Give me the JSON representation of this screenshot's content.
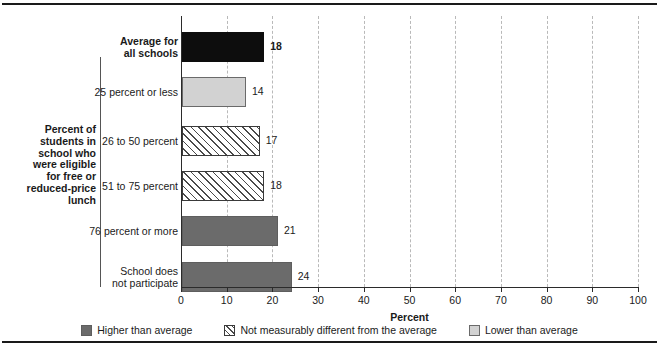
{
  "chart_data": {
    "type": "bar",
    "orientation": "horizontal",
    "title": "",
    "xlabel": "Percent",
    "ylabel": "Percent of students in school who were eligible for free or reduced-price lunch",
    "xlim": [
      0,
      100
    ],
    "xticks": [
      0,
      10,
      20,
      30,
      40,
      50,
      60,
      70,
      80,
      90,
      100
    ],
    "xtick_labels": [
      "0",
      "10",
      "20",
      "30",
      "40",
      "50",
      "60",
      "70",
      "80",
      "90",
      "100"
    ],
    "grid": "vertical-dashed",
    "legend_position": "bottom-center",
    "categories": [
      "Average for\nall schools",
      "25 percent or less",
      "26 to 50 percent",
      "51 to 75 percent",
      "76 percent or more",
      "School does\nnot participate"
    ],
    "values": [
      18,
      14,
      17,
      18,
      21,
      24
    ],
    "value_labels": [
      "18",
      "14",
      "17",
      "18",
      "21",
      "24"
    ],
    "bar_styles": [
      "black",
      "light",
      "hatch",
      "hatch",
      "dark",
      "dark"
    ],
    "bars": [
      {
        "category": "Average for\nall schools",
        "value": 18,
        "value_label": "18",
        "style": "black",
        "emphasis": true,
        "in_group": false
      },
      {
        "category": "25 percent or less",
        "value": 14,
        "value_label": "14",
        "style": "light",
        "emphasis": false,
        "in_group": true
      },
      {
        "category": "26 to 50 percent",
        "value": 17,
        "value_label": "17",
        "style": "hatch",
        "emphasis": false,
        "in_group": true
      },
      {
        "category": "51 to 75 percent",
        "value": 18,
        "value_label": "18",
        "style": "hatch",
        "emphasis": false,
        "in_group": true
      },
      {
        "category": "76 percent or more",
        "value": 21,
        "value_label": "21",
        "style": "dark",
        "emphasis": false,
        "in_group": true
      },
      {
        "category": "School does\nnot participate",
        "value": 24,
        "value_label": "24",
        "style": "dark",
        "emphasis": false,
        "in_group": true
      }
    ],
    "legend": [
      {
        "label": "Higher than average",
        "style": "dark",
        "color": "#6b6b6b"
      },
      {
        "label": "Not measurably different from the average",
        "style": "hatch",
        "color": "#ffffff"
      },
      {
        "label": "Lower than average",
        "style": "light",
        "color": "#d2d2d2"
      }
    ],
    "colors": {
      "black": "#0d0d0d",
      "dark": "#6b6b6b",
      "light": "#d2d2d2",
      "hatch_fill": "#ffffff",
      "hatch_line": "#4a4a4a",
      "axis": "#2b2b2b",
      "gridline": "#b9b9b9",
      "text": "#1a1a1a",
      "rule": "#1a1a1a"
    }
  },
  "axis": {
    "x_title": "Percent",
    "y_group_title": "Percent of\nstudents in\nschool who\nwere eligible\nfor free or\nreduced-price\nlunch"
  }
}
